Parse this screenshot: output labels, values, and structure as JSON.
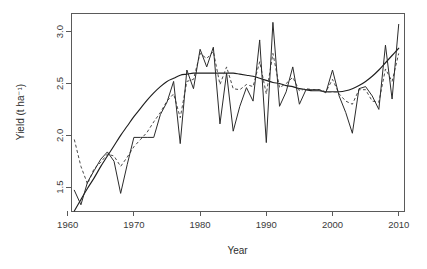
{
  "chart_data": {
    "type": "line",
    "title": "",
    "xlabel": "Year",
    "ylabel": "Yield (t ha⁻¹)",
    "xlim": [
      1960.5,
      2010.8
    ],
    "ylim": [
      1.27,
      3.18
    ],
    "xticks": [
      1960,
      1970,
      1980,
      1990,
      2000,
      2010
    ],
    "xtick_labels": [
      "1960",
      "1970",
      "1980",
      "1990",
      "2000",
      "2010"
    ],
    "yticks": [
      1.5,
      2.0,
      2.5,
      3.0
    ],
    "ytick_labels": [
      "1.5",
      "2.0",
      "2.5",
      "3.0"
    ],
    "grid": false,
    "legend": "none",
    "box": true,
    "x": [
      1961,
      1962,
      1963,
      1964,
      1965,
      1966,
      1967,
      1968,
      1969,
      1970,
      1971,
      1972,
      1973,
      1974,
      1975,
      1976,
      1977,
      1978,
      1979,
      1980,
      1981,
      1982,
      1983,
      1984,
      1985,
      1986,
      1987,
      1988,
      1989,
      1990,
      1991,
      1992,
      1993,
      1994,
      1995,
      1996,
      1997,
      1998,
      1999,
      2000,
      2001,
      2002,
      2003,
      2004,
      2005,
      2006,
      2007,
      2008,
      2009,
      2010
    ],
    "series": [
      {
        "name": "observed-yield",
        "style": "solid",
        "color": "#2b2b2b",
        "values": [
          1.47,
          1.33,
          1.55,
          1.66,
          1.77,
          1.84,
          1.75,
          1.44,
          1.72,
          1.98,
          1.98,
          1.98,
          1.98,
          2.2,
          2.32,
          2.52,
          1.92,
          2.63,
          2.45,
          2.83,
          2.66,
          2.85,
          2.11,
          2.6,
          2.04,
          2.28,
          2.46,
          2.33,
          2.92,
          1.93,
          3.09,
          2.28,
          2.42,
          2.66,
          2.3,
          2.44,
          2.44,
          2.44,
          2.41,
          2.63,
          2.38,
          2.22,
          2.02,
          2.45,
          2.47,
          2.38,
          2.25,
          2.87,
          2.35,
          3.07
        ]
      },
      {
        "name": "modelled-yield",
        "style": "dashed",
        "color": "#4a4a4a",
        "values": [
          1.96,
          1.7,
          1.53,
          1.68,
          1.74,
          1.82,
          1.8,
          1.7,
          1.79,
          1.89,
          1.96,
          2.03,
          2.13,
          2.22,
          2.33,
          2.4,
          2.17,
          2.52,
          2.54,
          2.79,
          2.74,
          2.81,
          2.49,
          2.66,
          2.45,
          2.44,
          2.49,
          2.47,
          2.71,
          2.4,
          2.79,
          2.46,
          2.5,
          2.56,
          2.43,
          2.45,
          2.44,
          2.44,
          2.42,
          2.54,
          2.4,
          2.33,
          2.3,
          2.44,
          2.44,
          2.33,
          2.32,
          2.64,
          2.52,
          2.79
        ]
      },
      {
        "name": "fitted-trend",
        "style": "smooth",
        "color": "#1f1f1f",
        "values": [
          1.27,
          1.38,
          1.49,
          1.59,
          1.7,
          1.8,
          1.9,
          2.0,
          2.09,
          2.18,
          2.26,
          2.34,
          2.41,
          2.47,
          2.52,
          2.55,
          2.58,
          2.59,
          2.6,
          2.6,
          2.6,
          2.6,
          2.6,
          2.6,
          2.6,
          2.59,
          2.58,
          2.57,
          2.55,
          2.53,
          2.51,
          2.5,
          2.48,
          2.47,
          2.45,
          2.44,
          2.43,
          2.43,
          2.42,
          2.42,
          2.42,
          2.43,
          2.45,
          2.48,
          2.52,
          2.57,
          2.63,
          2.7,
          2.77,
          2.84
        ]
      }
    ]
  },
  "geometry": {
    "plot_left": 71,
    "plot_right": 404,
    "plot_top": 13,
    "plot_bottom": 211
  }
}
